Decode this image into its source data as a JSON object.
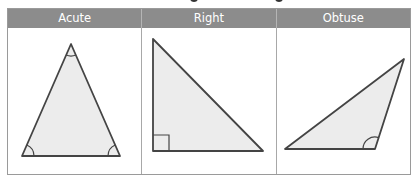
{
  "table": {
    "columns": [
      {
        "label": "Acute",
        "shape": "acute-triangle"
      },
      {
        "label": "Right",
        "shape": "right-triangle"
      },
      {
        "label": "Obtuse",
        "shape": "obtuse-triangle"
      }
    ]
  },
  "colors": {
    "header_bg": "#8c8c8c",
    "header_text": "#ffffff",
    "triangle_fill": "#ececec",
    "triangle_stroke": "#444444",
    "border": "#9a9a9a"
  }
}
